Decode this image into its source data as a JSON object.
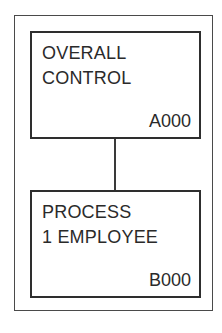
{
  "diagram": {
    "nodes": [
      {
        "id": "A000",
        "title_lines": [
          "OVERALL",
          "CONTROL"
        ],
        "code": "A000"
      },
      {
        "id": "B000",
        "title_lines": [
          "PROCESS",
          "1 EMPLOYEE"
        ],
        "code": "B000"
      }
    ],
    "edges": [
      {
        "from": "A000",
        "to": "B000"
      }
    ]
  }
}
